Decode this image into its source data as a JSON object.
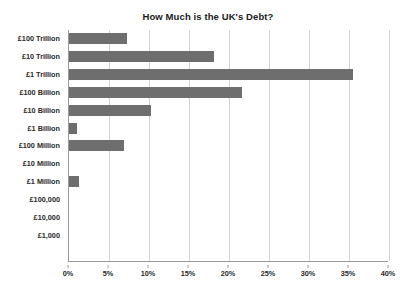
{
  "chart_data": {
    "type": "bar",
    "orientation": "horizontal",
    "title": "How Much is the UK's Debt?",
    "xlabel": "",
    "ylabel": "",
    "categories": [
      "£100 Trillion",
      "£10 Trillion",
      "£1 Trillion",
      "£100 Billion",
      "£10 Billion",
      "£1 Billion",
      "£100 Million",
      "£10 Million",
      "£1 Million",
      "£100,000",
      "£10,000",
      "£1,000"
    ],
    "values": [
      7.2,
      18.1,
      35.5,
      21.6,
      10.2,
      1.0,
      6.9,
      0.0,
      1.2,
      0.0,
      0.0,
      0.0
    ],
    "value_unit": "%",
    "xlim": [
      0,
      40
    ],
    "xticks": [
      0,
      5,
      10,
      15,
      20,
      25,
      30,
      35,
      40
    ],
    "xtick_labels": [
      "0%",
      "5%",
      "10%",
      "15%",
      "20%",
      "25%",
      "30%",
      "35%",
      "40%"
    ],
    "grid": "vertical",
    "legend": null,
    "bar_color": "#6e6e6e",
    "gridline_color": "#d2d2d2",
    "axis_color": "#9a9a9a",
    "background_color": "#ffffff"
  }
}
